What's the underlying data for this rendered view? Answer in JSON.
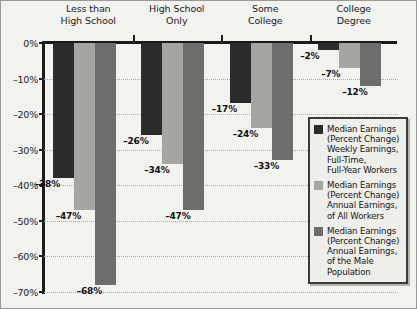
{
  "chart_data": {
    "type": "bar",
    "title": "",
    "xlabel": "",
    "ylabel": "",
    "grid": true,
    "legend_position": "inside-bottom-right",
    "categories": [
      "Less than High School",
      "High School Only",
      "Some College",
      "College Degree"
    ],
    "category_lines": [
      [
        "Less than",
        "High School"
      ],
      [
        "High School",
        "Only"
      ],
      [
        "Some",
        "College"
      ],
      [
        "College",
        "Degree"
      ]
    ],
    "ylim": [
      -70,
      0
    ],
    "ytick_values": [
      0,
      -10,
      -20,
      -30,
      -40,
      -50,
      -60,
      -70
    ],
    "ytick_labels": [
      "0%",
      "–10%",
      "–20%",
      "–30%",
      "–40%",
      "–50%",
      "–60%",
      "–70%"
    ],
    "series": [
      {
        "name": "Median Earnings (Percent Change) Weekly Earnings, Full-Time, Full-Year Workers",
        "color": "#2b2b2b",
        "values": [
          -38,
          -26,
          -17,
          -2
        ],
        "value_labels": [
          "–38%",
          "–26%",
          "–17%",
          "–2%"
        ]
      },
      {
        "name": "Median Earnings (Percent Change) Annual Earnings, of All Workers",
        "color": "#a5a5a2",
        "values": [
          -47,
          -34,
          -24,
          -7
        ],
        "value_labels": [
          "–47%",
          "–34%",
          "–24%",
          "–7%"
        ]
      },
      {
        "name": "Median Earnings (Percent Change) Annual Earnings, of the Male Population",
        "color": "#6d6d6b",
        "values": [
          -68,
          -47,
          -33,
          -12
        ],
        "value_labels": [
          "–68%",
          "–47%",
          "–33%",
          "–12%"
        ]
      }
    ]
  },
  "legend": {
    "entries": [
      {
        "swatch": "s0",
        "lines": [
          "Median Earnings",
          "(Percent Change)",
          "Weekly Earnings,",
          "Full-Time,",
          "Full-Year Workers"
        ]
      },
      {
        "swatch": "s1",
        "lines": [
          "Median Earnings",
          "(Percent Change)",
          "Annual Earnings,",
          "of All Workers"
        ]
      },
      {
        "swatch": "s2",
        "lines": [
          "Median Earnings",
          "(Percent Change)",
          "Annual Earnings,",
          "of the Male",
          "Population"
        ]
      }
    ]
  },
  "colors": {
    "background": "#f2f2ef",
    "axis": "#1a1a1a",
    "grid": "#a8a8a4",
    "series_dark": "#2b2b2b",
    "series_light": "#a5a5a2",
    "series_medium": "#6d6d6b"
  }
}
